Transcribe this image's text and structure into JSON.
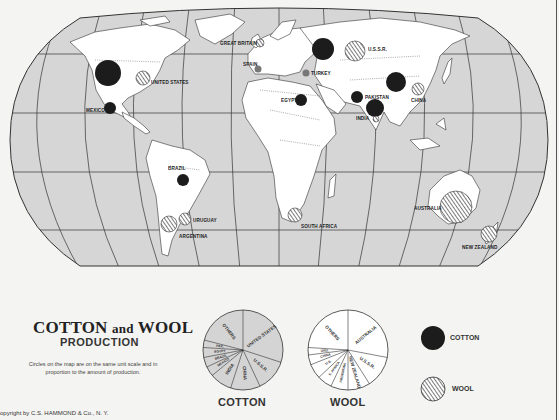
{
  "title": {
    "main_left": "COTTON",
    "main_and": "and",
    "main_right": "WOOL",
    "subtitle": "PRODUCTION",
    "note": "Circles on the map are on the same unit scale and in proportion to the amount of production."
  },
  "copyright": "opyright by C.S. HAMMOND & Co., N. Y.",
  "colors": {
    "ocean": "#d6d6d6",
    "land": "#ffffff",
    "cotton_fill": "#1c1c1c",
    "wool_hatch": "#333333",
    "pie_cotton_fill": "#d4d4d4",
    "pie_wool_fill": "#ffffff",
    "background": "#f4f4f2"
  },
  "map": {
    "projection": "oval world (Robinson-like)",
    "countries": [
      {
        "name": "UNITED STATES",
        "label": "UNITED STATES",
        "cotton": {
          "x": 108,
          "y": 73,
          "r": 13
        },
        "wool": {
          "x": 143,
          "y": 78,
          "r": 7
        }
      },
      {
        "name": "MEXICO",
        "label": "MEXICO",
        "cotton": {
          "x": 110,
          "y": 108,
          "r": 6
        }
      },
      {
        "name": "BRAZIL",
        "label": "BRAZIL",
        "cotton": {
          "x": 183,
          "y": 180,
          "r": 6
        }
      },
      {
        "name": "URUGUAY",
        "label": "URUGUAY",
        "wool": {
          "x": 185,
          "y": 219,
          "r": 6
        }
      },
      {
        "name": "ARGENTINA",
        "label": "ARGENTINA",
        "wool": {
          "x": 169,
          "y": 224,
          "r": 8
        }
      },
      {
        "name": "GREAT BRITAIN",
        "label": "GREAT BRITAIN",
        "wool": {
          "x": 260,
          "y": 43,
          "r": 4
        }
      },
      {
        "name": "SPAIN",
        "label": "SPAIN",
        "cotton": {
          "x": 258,
          "y": 69,
          "r": 3
        },
        "wool": {
          "x": 258,
          "y": 69,
          "r": 3
        }
      },
      {
        "name": "TURKEY",
        "label": "TURKEY",
        "cotton": {
          "x": 306,
          "y": 73,
          "r": 3
        },
        "wool": {
          "x": 306,
          "y": 73,
          "r": 3
        }
      },
      {
        "name": "EGYPT",
        "label": "EGYPT",
        "cotton": {
          "x": 301,
          "y": 100,
          "r": 6
        }
      },
      {
        "name": "U.S.S.R.",
        "label": "U.S.S.R.",
        "cotton": {
          "x": 323,
          "y": 49,
          "r": 11
        },
        "wool": {
          "x": 355,
          "y": 51,
          "r": 10
        }
      },
      {
        "name": "PAKISTAN",
        "label": "PAKISTAN",
        "cotton": {
          "x": 357,
          "y": 97,
          "r": 6
        }
      },
      {
        "name": "INDIA",
        "label": "INDIA",
        "cotton": {
          "x": 375,
          "y": 108,
          "r": 9
        },
        "wool": {
          "x": 376,
          "y": 119,
          "r": 3
        }
      },
      {
        "name": "CHINA",
        "label": "CHINA",
        "cotton": {
          "x": 396,
          "y": 82,
          "r": 10
        },
        "wool": {
          "x": 418,
          "y": 89,
          "r": 6
        }
      },
      {
        "name": "SOUTH AFRICA",
        "label": "SOUTH AFRICA",
        "wool": {
          "x": 295,
          "y": 215,
          "r": 7
        }
      },
      {
        "name": "AUSTRALIA",
        "label": "AUSTRALIA",
        "wool": {
          "x": 456,
          "y": 207,
          "r": 16
        }
      },
      {
        "name": "NEW ZEALAND",
        "label": "NEW ZEALAND",
        "wool": {
          "x": 489,
          "y": 234,
          "r": 8
        }
      }
    ]
  },
  "chart_data": [
    {
      "type": "pie",
      "title": "COTTON",
      "categories": [
        "UNITED STATES",
        "U.S.S.R.",
        "CHINA",
        "INDIA",
        "MEXICO",
        "BRAZIL",
        "EGYPT",
        "PAK.",
        "OTHERS"
      ],
      "values": [
        30,
        13,
        12,
        9,
        4,
        4,
        4,
        3,
        21
      ],
      "unit": "approx. % of world production (estimated from slice angles)"
    },
    {
      "type": "pie",
      "title": "WOOL",
      "categories": [
        "AUSTRALIA",
        "U.S.S.R.",
        "NEW ZEALAND",
        "ARGENTINA",
        "S. AFRICA",
        "U.S.",
        "CHINA",
        "URU.",
        "OTHERS"
      ],
      "values": [
        28,
        13,
        9,
        7,
        6,
        6,
        4,
        3,
        24
      ],
      "unit": "approx. % of world production (estimated from slice angles)"
    }
  ],
  "pies": {
    "cotton": {
      "label": "COTTON",
      "slices": [
        {
          "label": "UNITED STATES",
          "value": 30
        },
        {
          "label": "U.S.S.R.",
          "value": 13
        },
        {
          "label": "CHINA",
          "value": 12
        },
        {
          "label": "INDIA",
          "value": 9
        },
        {
          "label": "MEXICO",
          "value": 4
        },
        {
          "label": "BRAZIL",
          "value": 4
        },
        {
          "label": "EGYPT",
          "value": 4
        },
        {
          "label": "PAK.",
          "value": 3
        },
        {
          "label": "OTHERS",
          "value": 21
        }
      ]
    },
    "wool": {
      "label": "WOOL",
      "slices": [
        {
          "label": "AUSTRALIA",
          "value": 28
        },
        {
          "label": "U.S.S.R.",
          "value": 13
        },
        {
          "label": "NEW ZEALAND",
          "value": 9
        },
        {
          "label": "ARGENTINA",
          "value": 7
        },
        {
          "label": "S. AFRICA",
          "value": 6
        },
        {
          "label": "U.S.",
          "value": 6
        },
        {
          "label": "CHINA",
          "value": 4
        },
        {
          "label": "URU.",
          "value": 3
        },
        {
          "label": "OTHERS",
          "value": 24
        }
      ]
    }
  },
  "legend": {
    "cotton_label": "COTTON",
    "wool_label": "WOOL"
  }
}
